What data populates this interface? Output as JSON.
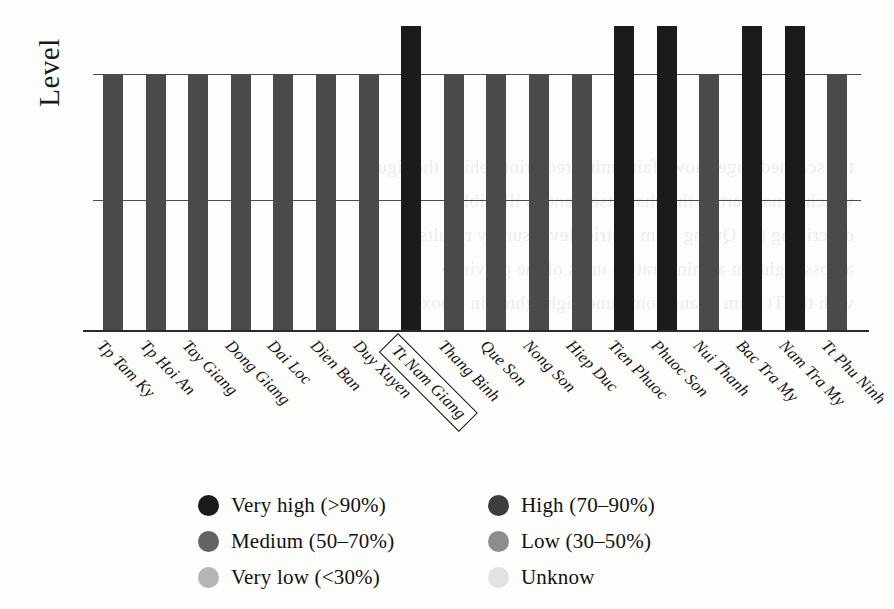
{
  "chart_data": {
    "type": "bar",
    "title": "",
    "xlabel": "",
    "ylabel": "Level",
    "ylim": [
      0,
      100
    ],
    "grid": true,
    "gridlines": [
      50,
      80
    ],
    "legend_position": "bottom",
    "highlighted_category": "Tt Nam Giang",
    "categories": [
      "Tp Tam Ky",
      "Tp Hoi An",
      "Tay Giang",
      "Dong Giang",
      "Dai Loc",
      "Dien Ban",
      "Duy Xuyen",
      "Tt Nam Giang",
      "Thang Binh",
      "Que Son",
      "Nong Son",
      "Hiep Duc",
      "Tien Phuoc",
      "Phuoc Son",
      "Nui Thanh",
      "Bac Tra My",
      "Nam Tra My",
      "Tt Phu Ninh"
    ],
    "values": [
      80,
      80,
      80,
      80,
      80,
      80,
      80,
      95,
      80,
      80,
      80,
      80,
      95,
      95,
      80,
      95,
      95,
      80
    ],
    "levels": [
      "High (70-90%)",
      "High (70-90%)",
      "High (70-90%)",
      "High (70-90%)",
      "High (70-90%)",
      "High (70-90%)",
      "High (70-90%)",
      "Very high (>90%)",
      "High (70-90%)",
      "High (70-90%)",
      "High (70-90%)",
      "High (70-90%)",
      "Very high (>90%)",
      "Very high (>90%)",
      "High (70-90%)",
      "Very high (>90%)",
      "Very high (>90%)",
      "High (70-90%)"
    ],
    "bar_colors": [
      "#4a4a4a",
      "#4a4a4a",
      "#4a4a4a",
      "#4a4a4a",
      "#4a4a4a",
      "#4a4a4a",
      "#4a4a4a",
      "#1b1b1b",
      "#4a4a4a",
      "#4a4a4a",
      "#4a4a4a",
      "#4a4a4a",
      "#1b1b1b",
      "#1b1b1b",
      "#4a4a4a",
      "#1b1b1b",
      "#1b1b1b",
      "#4a4a4a"
    ]
  },
  "legend": {
    "items": [
      {
        "label": "Very high (>90%)",
        "color": "#1b1b1b"
      },
      {
        "label": "High (70–90%)",
        "color": "#3d3d3d"
      },
      {
        "label": "Medium (50–70%)",
        "color": "#636363"
      },
      {
        "label": "Low (30–50%)",
        "color": "#8d8d8d"
      },
      {
        "label": "Very low (<30%)",
        "color": "#b5b5b5"
      },
      {
        "label": "Unknow",
        "color": "#e2e2e2"
      }
    ]
  },
  "bleed_text": [
    "the scanned page shows faint mirrored print behind the figure",
    "which is not part of the chart itself and is illegible",
    "describing the Quang Nam district level survey results",
    "across eighteen administrative units of the province",
    "with the Tt Nam Giang commune highlighted in a box"
  ]
}
